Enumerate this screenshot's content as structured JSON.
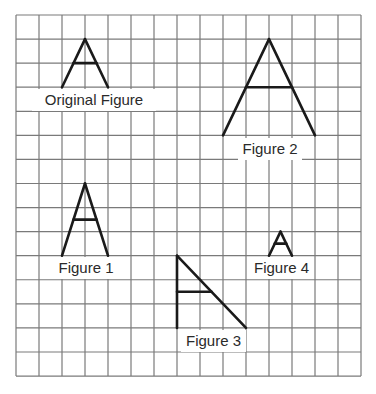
{
  "diagram": {
    "type": "grid-figures",
    "grid": {
      "cols": 15,
      "rows": 15,
      "origin_x": 16,
      "origin_y": 15,
      "cell_w": 23,
      "cell_h": 24.07,
      "line_color": "#7a7a7a",
      "figure_color": "#1a1a1a"
    },
    "figures": [
      {
        "id": "original",
        "label": "Original Figure",
        "label_box": {
          "x": 32,
          "y": 89,
          "w": 124,
          "h": 22
        },
        "segments": [
          [
            [
              3,
              1
            ],
            [
              2,
              3
            ]
          ],
          [
            [
              3,
              1
            ],
            [
              4,
              3
            ]
          ],
          [
            [
              2.5,
              2
            ],
            [
              3.5,
              2
            ]
          ]
        ]
      },
      {
        "id": "figure-1",
        "label": "Figure 1",
        "label_box": {
          "x": 55,
          "y": 257,
          "w": 62,
          "h": 22
        },
        "segments": [
          [
            [
              3,
              7
            ],
            [
              2,
              10
            ]
          ],
          [
            [
              3,
              7
            ],
            [
              4,
              10
            ]
          ],
          [
            [
              2.5,
              8.5
            ],
            [
              3.5,
              8.5
            ]
          ]
        ]
      },
      {
        "id": "figure-2",
        "label": "Figure 2",
        "label_box": {
          "x": 238,
          "y": 138,
          "w": 64,
          "h": 22
        },
        "segments": [
          [
            [
              11,
              1
            ],
            [
              9,
              5
            ]
          ],
          [
            [
              11,
              1
            ],
            [
              13,
              5
            ]
          ],
          [
            [
              10,
              3
            ],
            [
              12,
              3
            ]
          ]
        ]
      },
      {
        "id": "figure-3",
        "label": "Figure 3",
        "label_box": {
          "x": 181,
          "y": 330,
          "w": 65,
          "h": 22
        },
        "segments": [
          [
            [
              7,
              10
            ],
            [
              7,
              13
            ]
          ],
          [
            [
              7,
              10
            ],
            [
              10,
              13
            ]
          ],
          [
            [
              7,
              11.5
            ],
            [
              8.5,
              11.5
            ]
          ]
        ]
      },
      {
        "id": "figure-4",
        "label": "Figure 4",
        "label_box": {
          "x": 250,
          "y": 257,
          "w": 63,
          "h": 22
        },
        "segments": [
          [
            [
              11.5,
              9
            ],
            [
              11,
              10
            ]
          ],
          [
            [
              11.5,
              9
            ],
            [
              12,
              10
            ]
          ],
          [
            [
              11.25,
              9.5
            ],
            [
              11.75,
              9.5
            ]
          ]
        ]
      }
    ]
  }
}
